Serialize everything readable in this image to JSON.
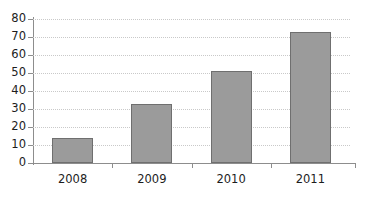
{
  "chart_data": {
    "type": "bar",
    "title": "",
    "subtitle": "",
    "xlabel": "",
    "ylabel": "",
    "categories": [
      "2008",
      "2009",
      "2010",
      "2011"
    ],
    "values": [
      14,
      33,
      51,
      73
    ],
    "ylim": [
      0,
      80
    ],
    "yticks": [
      0,
      10,
      20,
      30,
      40,
      50,
      60,
      70,
      80
    ],
    "ytick_labels": [
      "0",
      "10",
      "20",
      "30",
      "40",
      "50",
      "60",
      "70",
      "80"
    ],
    "grid": true,
    "grid_axis": "y",
    "grid_style": "dotted",
    "legend": false,
    "legend_position": "none",
    "annotations": [],
    "colors": {
      "bar_fill": "#9b9b9b",
      "bar_border": "#6f6f6f",
      "gridline": "#c9c9c9",
      "axis": "#8d8d8d",
      "text": "#1d1d1d",
      "background": "#ffffff"
    }
  }
}
